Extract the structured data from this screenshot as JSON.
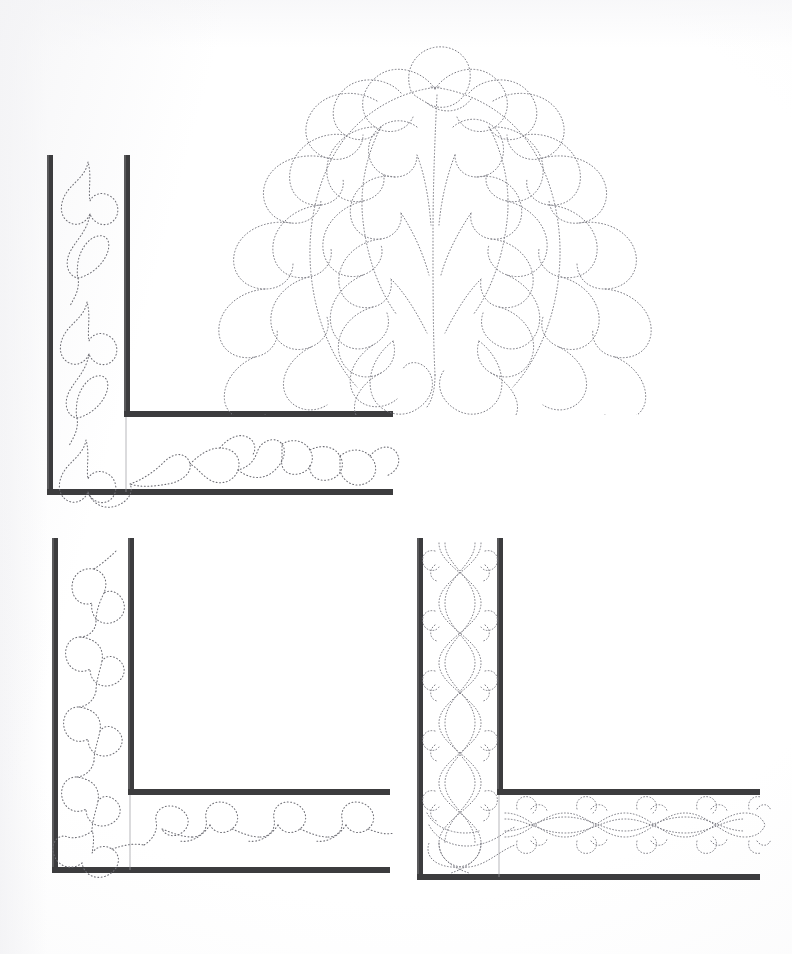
{
  "page": {
    "kind": "scanned-line-art-page",
    "width": 792,
    "height": 954,
    "background_color": "#fefefe",
    "rail_color": "#3c3c3e",
    "stitch_color": "#6d6d74",
    "stitch_style": "dotted"
  },
  "designs": [
    {
      "id": "corner-vine-leaf",
      "name": "Top-left corner border: vine with leaves and tulip blossoms",
      "position": "top-left",
      "motif": "vine-leaf-blossom",
      "rails": {
        "outer_vertical_x": 48,
        "inner_vertical_x": 125,
        "inner_horizontal_y": 411,
        "outer_horizontal_y": 489,
        "vertical_top_y": 155,
        "horizontal_right_x": 393,
        "thickness": 6
      }
    },
    {
      "id": "feather-plume-wreath",
      "name": "Top-right feather plume with flanking feather arcs",
      "position": "top-right",
      "motif": "feather-plume",
      "bounds": {
        "x": 150,
        "y": 40,
        "width": 540,
        "height": 360
      }
    },
    {
      "id": "corner-clover",
      "name": "Bottom-left corner border: clover / trefoil chain",
      "position": "bottom-left",
      "motif": "clover-trefoil",
      "rails": {
        "outer_vertical_x": 52,
        "inner_vertical_x": 128,
        "inner_horizontal_y": 793,
        "outer_horizontal_y": 867,
        "vertical_top_y": 538,
        "horizontal_right_x": 393,
        "thickness": 6
      }
    },
    {
      "id": "corner-cable-braid",
      "name": "Bottom-right corner border: twisted cable braid with curl finials",
      "position": "bottom-right",
      "motif": "cable-braid",
      "rails": {
        "outer_vertical_x": 417,
        "inner_vertical_x": 497,
        "inner_horizontal_y": 793,
        "outer_horizontal_y": 876,
        "vertical_top_y": 538,
        "horizontal_right_x": 760,
        "thickness": 6
      }
    }
  ]
}
